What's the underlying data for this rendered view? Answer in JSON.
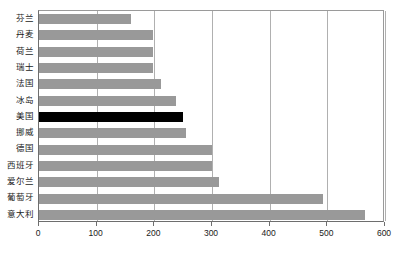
{
  "chart_data": {
    "type": "bar",
    "orientation": "horizontal",
    "title": "",
    "subtitle": "",
    "xlabel": "",
    "ylabel": "",
    "xlim": [
      0,
      600
    ],
    "xticks": [
      0,
      100,
      200,
      300,
      400,
      500,
      600
    ],
    "xtick_labels": [
      "0",
      "100",
      "200",
      "300",
      "400",
      "500",
      "600"
    ],
    "grid": true,
    "grid_axis": "x",
    "legend": false,
    "legend_position": "none",
    "categories": [
      "芬兰",
      "丹麦",
      "荷兰",
      "瑞士",
      "法国",
      "冰岛",
      "美国",
      "挪威",
      "德国",
      "西班牙",
      "爱尔兰",
      "葡萄牙",
      "意大利"
    ],
    "values": [
      160,
      198,
      198,
      198,
      212,
      238,
      250,
      255,
      300,
      300,
      313,
      493,
      565
    ],
    "highlight_index": 6,
    "highlight_category": "美国",
    "colors": {
      "bar": "#999999",
      "bar_highlight": "#000000",
      "gridline": "#b0b0b0",
      "axis": "#6e6e6e",
      "plot_border": "#9a9a9a",
      "text": "#1a1a1a",
      "background": "#ffffff"
    }
  }
}
